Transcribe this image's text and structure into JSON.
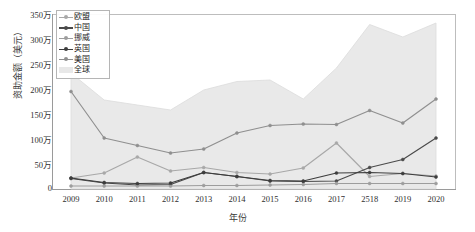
{
  "chart_data": {
    "type": "line",
    "title": "",
    "xlabel": "年份",
    "ylabel": "资助金额（美元）",
    "grid": false,
    "legend_position": "top-left",
    "x": [
      "2009",
      "2010",
      "2011",
      "2012",
      "2013",
      "2014",
      "2015",
      "2016",
      "2017",
      "2518",
      "2019",
      "2020"
    ],
    "xtick_labels": [
      "2009",
      "2010",
      "2011",
      "2012",
      "2013",
      "2014",
      "2015",
      "2016",
      "2017",
      "2518",
      "2019",
      "2020"
    ],
    "ytick_labels": [
      "0",
      "50万",
      "100万",
      "150万",
      "200万",
      "250万",
      "300万",
      "350万"
    ],
    "ytick_values": [
      0,
      500000,
      1000000,
      1500000,
      2000000,
      2500000,
      3000000,
      3500000
    ],
    "ylim": [
      0,
      3500000
    ],
    "y_unit": "万",
    "series": [
      {
        "name": "欧盟",
        "color": "#a8a8a8",
        "marker": "circle",
        "values": [
          220000,
          320000,
          640000,
          360000,
          430000,
          330000,
          300000,
          420000,
          920000,
          250000,
          310000,
          260000
        ]
      },
      {
        "name": "中国",
        "color": "#4a4a4a",
        "marker": "circle",
        "values": [
          210000,
          120000,
          80000,
          90000,
          330000,
          250000,
          160000,
          150000,
          160000,
          430000,
          590000,
          1020000
        ]
      },
      {
        "name": "挪威",
        "color": "#9d9d9d",
        "marker": "circle",
        "values": [
          60000,
          60000,
          60000,
          60000,
          70000,
          70000,
          80000,
          90000,
          110000,
          110000,
          110000,
          110000
        ]
      },
      {
        "name": "英国",
        "color": "#3d3d3d",
        "marker": "circle",
        "values": [
          220000,
          130000,
          110000,
          120000,
          330000,
          250000,
          170000,
          160000,
          320000,
          330000,
          310000,
          240000
        ]
      },
      {
        "name": "美国",
        "color": "#8f8f8f",
        "marker": "circle",
        "values": [
          1950000,
          1020000,
          870000,
          720000,
          800000,
          1120000,
          1270000,
          1300000,
          1290000,
          1570000,
          1320000,
          1800000
        ]
      },
      {
        "name": "全球",
        "color": "#e8e8e8",
        "marker": "none",
        "type": "area",
        "values": [
          2320000,
          1780000,
          1680000,
          1580000,
          1980000,
          2150000,
          2180000,
          1800000,
          2420000,
          3290000,
          3040000,
          3320000
        ]
      }
    ]
  },
  "legend": {
    "items": [
      {
        "label": "欧盟",
        "color": "#a8a8a8",
        "kind": "line"
      },
      {
        "label": "中国",
        "color": "#4a4a4a",
        "kind": "line"
      },
      {
        "label": "挪威",
        "color": "#9d9d9d",
        "kind": "line"
      },
      {
        "label": "英国",
        "color": "#3d3d3d",
        "kind": "line"
      },
      {
        "label": "美国",
        "color": "#8f8f8f",
        "kind": "line"
      },
      {
        "label": "全球",
        "color": "#e8e8e8",
        "kind": "area"
      }
    ]
  },
  "colors": {
    "axis": "#9a9a9a",
    "text": "#2f2f2f",
    "background": "#ffffff",
    "area_fill": "#e8e8e8"
  }
}
